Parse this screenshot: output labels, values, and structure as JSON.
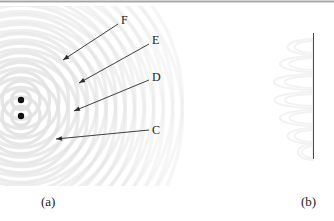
{
  "figure": {
    "kind": "two-source-interference-diagram",
    "background_color": "#ffffff"
  },
  "panel_a": {
    "caption": "(a)",
    "description": "two point sources emitting circular waves producing an interference pattern",
    "wave_color": "#e2e2e2",
    "source_color": "#101010",
    "sources": [
      {
        "name": "source-upper",
        "x": 21,
        "y": 94,
        "r": 3.2
      },
      {
        "name": "source-lower",
        "x": 21,
        "y": 110,
        "r": 3.2
      }
    ],
    "wavelength_px": 9.5,
    "ring_count": 17,
    "annotations": [
      {
        "label": "F",
        "label_x": 121,
        "label_y": 8,
        "leader_from_x": 118,
        "leader_from_y": 18,
        "leader_to_x": 63,
        "leader_to_y": 54
      },
      {
        "label": "E",
        "label_x": 152,
        "label_y": 28,
        "leader_from_x": 149,
        "leader_from_y": 38,
        "leader_to_x": 79,
        "leader_to_y": 77
      },
      {
        "label": "D",
        "label_x": 152,
        "label_y": 65,
        "leader_from_x": 149,
        "leader_from_y": 74,
        "leader_to_x": 74,
        "leader_to_y": 105
      },
      {
        "label": "C",
        "label_x": 152,
        "label_y": 118,
        "leader_from_x": 149,
        "leader_from_y": 124,
        "leader_to_x": 56,
        "leader_to_y": 133
      }
    ]
  },
  "panel_b": {
    "caption": "(b)",
    "description": "detection screen with interference intensity fringe profile",
    "screen_line_color": "#4b4b4b",
    "fringe_color": "#f2f2f2",
    "screen_x": 63,
    "screen_y_top": 27,
    "screen_y_bottom": 153,
    "fringe_peaks": [
      {
        "y": 41,
        "amplitude": 34
      },
      {
        "y": 58,
        "amplitude": 44
      },
      {
        "y": 76,
        "amplitude": 52
      },
      {
        "y": 94,
        "amplitude": 52
      },
      {
        "y": 112,
        "amplitude": 44
      },
      {
        "y": 130,
        "amplitude": 34
      },
      {
        "y": 146,
        "amplitude": 20
      }
    ]
  },
  "chart_data": {
    "type": "line",
    "title": "",
    "xlabel": "",
    "ylabel": "",
    "series": [
      {
        "name": "fringe-intensity",
        "y": [
          41,
          58,
          76,
          94,
          112,
          130,
          146
        ],
        "values": [
          34,
          44,
          52,
          52,
          44,
          34,
          20
        ]
      }
    ]
  }
}
